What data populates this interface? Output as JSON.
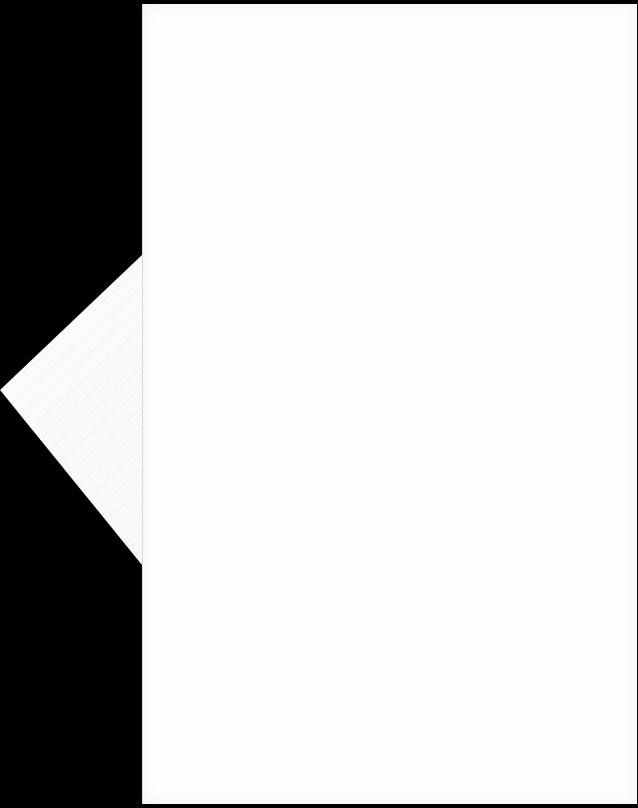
{
  "scene": {
    "background_color": "#000000",
    "description": "Blank white paper sheet over black background"
  },
  "front_sheet": {
    "color": "#fdfdfd",
    "text": ""
  },
  "back_sheet": {
    "color": "#f6f6f6",
    "text": ""
  }
}
